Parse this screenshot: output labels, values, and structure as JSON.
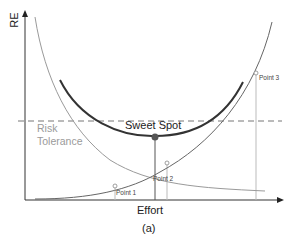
{
  "diagram": {
    "y_axis_label": "RE",
    "x_axis_label": "Effort",
    "caption": "(a)",
    "annotations": {
      "sweet_spot": "Sweet Spot",
      "risk_tolerance_line1": "Risk",
      "risk_tolerance_line2": "Tolerance",
      "point1": "Point 1",
      "point2": "Point 2",
      "point3": "Point 3"
    },
    "curves": [
      {
        "name": "decreasing-risk-curve",
        "color": "#9a9a9a",
        "trend": "decreasing"
      },
      {
        "name": "increasing-effort-curve",
        "color": "#555555",
        "trend": "increasing"
      },
      {
        "name": "sweet-spot-curve",
        "color": "#333333",
        "trend": "u-shaped"
      }
    ],
    "risk_tolerance_line": {
      "style": "dashed",
      "color": "#777777"
    },
    "colors": {
      "axis": "#333333",
      "sweet_dot": "#555555",
      "guide": "#bbbbbb"
    }
  }
}
